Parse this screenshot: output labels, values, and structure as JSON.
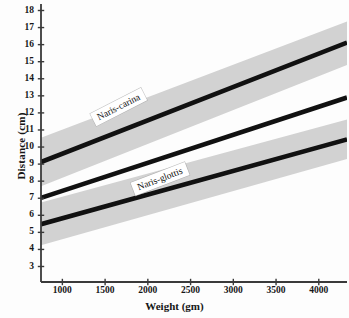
{
  "chart_data": {
    "type": "line",
    "title": "",
    "subtitle": "",
    "xlabel": "Weight (gm)",
    "ylabel": "Distance (cm)",
    "xlim": [
      750,
      4330
    ],
    "ylim": [
      3,
      18
    ],
    "xticks": [
      1000,
      1500,
      2000,
      2500,
      3000,
      3500,
      4000
    ],
    "xtick_labels": [
      "1000",
      "1500",
      "2000",
      "2500",
      "3000",
      "3500",
      "4000"
    ],
    "yticks": [
      3,
      4,
      5,
      6,
      7,
      8,
      9,
      10,
      11,
      12,
      13,
      14,
      15,
      16,
      17,
      18
    ],
    "ytick_labels": [
      "3",
      "4",
      "5",
      "6",
      "7",
      "8",
      "9",
      "10",
      "11",
      "12",
      "13",
      "14",
      "15",
      "16",
      "17",
      "18"
    ],
    "grid": false,
    "legend": "inline-labels",
    "band_color": "#d2d2d2",
    "line_color": "#111111",
    "axis_color": "#3a3a3a",
    "background": "#fdfdfd",
    "series": [
      {
        "name": "Naris-carina",
        "x": [
          750,
          4330
        ],
        "values": [
          9.12,
          16.12
        ],
        "band_upper": [
          10.55,
          17.35
        ],
        "band_lower": [
          7.7,
          14.8
        ],
        "label": "Naris-carina",
        "label_x": 1720,
        "label_y": 12.35
      },
      {
        "name": "unlabeled-middle",
        "x": [
          750,
          4330
        ],
        "values": [
          7.02,
          12.9
        ],
        "band_upper": [
          null,
          null
        ],
        "band_lower": [
          null,
          null
        ],
        "label": "",
        "label_x": null,
        "label_y": null
      },
      {
        "name": "Naris-glottis",
        "x": [
          750,
          4330
        ],
        "values": [
          5.48,
          10.45
        ],
        "band_upper": [
          6.75,
          11.62
        ],
        "band_lower": [
          4.25,
          9.3
        ],
        "label": "Naris-glottis",
        "label_x": 2200,
        "label_y": 8.1
      }
    ],
    "annotations": [
      {
        "text": "Naris-carina",
        "x": 1720,
        "y": 12.35,
        "rotation": -27
      },
      {
        "text": "Naris-glottis",
        "x": 2200,
        "y": 8.1,
        "rotation": -21
      }
    ]
  },
  "axes": {
    "y_axis_title": "Distance (cm)",
    "x_axis_title": "Weight (gm)"
  }
}
